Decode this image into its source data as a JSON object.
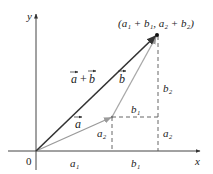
{
  "diagram": {
    "axes": {
      "x_label": "x",
      "y_label": "y",
      "origin_label": "0"
    },
    "vectors": [
      {
        "name": "a",
        "label": "a",
        "has_arrow": true,
        "color": "#999999"
      },
      {
        "name": "b",
        "label": "b",
        "has_arrow": true,
        "color": "#aaaaaa"
      },
      {
        "name": "a_plus_b",
        "label": "a + b",
        "has_arrow": true,
        "color": "#333333"
      }
    ],
    "endpoint_label": "(a₁ + b₁, a₂ + b₂)",
    "component_labels": {
      "a1": "a₁",
      "b1_bottom": "b₁",
      "b1_mid": "b₁",
      "a2_left": "a₂",
      "a2_right": "a₂",
      "b2": "b₂"
    },
    "colors": {
      "axis": "#333333",
      "dashed": "#555555",
      "sum_vector": "#333333",
      "component_vectors": "#a0a0a0"
    }
  }
}
